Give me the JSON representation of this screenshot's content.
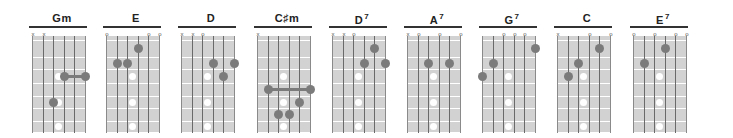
{
  "diagram": {
    "type": "guitar-chord-chart",
    "colors": {
      "fretboard": "#d2d2d2",
      "finger_dot": "#7b7b7b",
      "inlay": "#ffffff",
      "rule": "#333333"
    },
    "inlay_frets": [
      3,
      5,
      7
    ],
    "chords": [
      {
        "name": "Gm",
        "sup": "",
        "x": 27,
        "markers": [
          "x",
          "x",
          "",
          "",
          "",
          ""
        ],
        "dots": [
          {
            "string": 3,
            "fret": 5
          }
        ],
        "barre": {
          "from": 4,
          "to": 6,
          "fret": 3
        }
      },
      {
        "name": "E",
        "sup": "",
        "x": 101,
        "markers": [
          "o",
          "",
          "",
          "",
          "o",
          "o"
        ],
        "dots": [
          {
            "string": 2,
            "fret": 2
          },
          {
            "string": 3,
            "fret": 2
          },
          {
            "string": 4,
            "fret": 1
          }
        ],
        "barre": null
      },
      {
        "name": "D",
        "sup": "",
        "x": 176,
        "markers": [
          "x",
          "x",
          "o",
          "",
          "",
          ""
        ],
        "dots": [
          {
            "string": 4,
            "fret": 2
          },
          {
            "string": 5,
            "fret": 3
          },
          {
            "string": 6,
            "fret": 2
          }
        ],
        "barre": null
      },
      {
        "name": "C♯m",
        "sup": "",
        "x": 252,
        "markers": [
          "x",
          "",
          "",
          "",
          "",
          ""
        ],
        "dots": [
          {
            "string": 5,
            "fret": 5
          },
          {
            "string": 3,
            "fret": 6
          },
          {
            "string": 4,
            "fret": 6
          }
        ],
        "barre": {
          "from": 2,
          "to": 6,
          "fret": 4
        }
      },
      {
        "name": "D",
        "sup": "7",
        "x": 327,
        "markers": [
          "x",
          "x",
          "o",
          "",
          "",
          ""
        ],
        "dots": [
          {
            "string": 4,
            "fret": 2
          },
          {
            "string": 5,
            "fret": 1
          },
          {
            "string": 6,
            "fret": 2
          }
        ],
        "barre": null
      },
      {
        "name": "A",
        "sup": "7",
        "x": 402,
        "markers": [
          "x",
          "o",
          "",
          "o",
          "",
          "o"
        ],
        "dots": [
          {
            "string": 3,
            "fret": 2
          },
          {
            "string": 5,
            "fret": 2
          }
        ],
        "barre": null
      },
      {
        "name": "G",
        "sup": "7",
        "x": 477,
        "markers": [
          "",
          "",
          "o",
          "o",
          "o",
          ""
        ],
        "dots": [
          {
            "string": 1,
            "fret": 3
          },
          {
            "string": 2,
            "fret": 2
          },
          {
            "string": 6,
            "fret": 1
          }
        ],
        "barre": null
      },
      {
        "name": "C",
        "sup": "",
        "x": 552,
        "markers": [
          "x",
          "",
          "",
          "o",
          "",
          "o"
        ],
        "dots": [
          {
            "string": 2,
            "fret": 3
          },
          {
            "string": 3,
            "fret": 2
          },
          {
            "string": 5,
            "fret": 1
          }
        ],
        "barre": null
      },
      {
        "name": "E",
        "sup": "7",
        "x": 628,
        "markers": [
          "o",
          "",
          "o",
          "",
          "o",
          "o"
        ],
        "dots": [
          {
            "string": 2,
            "fret": 2
          },
          {
            "string": 4,
            "fret": 1
          }
        ],
        "barre": null
      }
    ]
  }
}
